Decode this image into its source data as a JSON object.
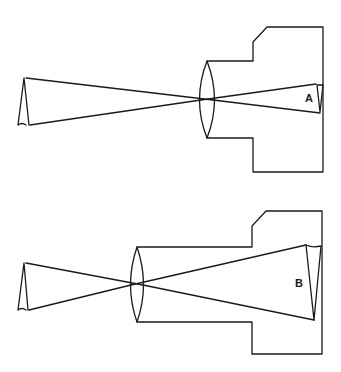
{
  "diagrams": [
    {
      "id": "A",
      "label": "A",
      "description": "Camera with short lens-to-film distance producing a small inverted image"
    },
    {
      "id": "B",
      "label": "B",
      "description": "Camera with long lens-to-film distance producing a large inverted image"
    }
  ],
  "colors": {
    "line": "#1a1a1a",
    "background": "#ffffff"
  }
}
